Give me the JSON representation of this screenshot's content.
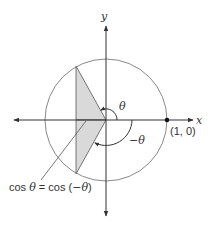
{
  "diagram": {
    "axes": {
      "x_label": "x",
      "y_label": "y"
    },
    "unit_circle": {
      "point_label": "(1, 0)"
    },
    "angles": {
      "positive_label": "θ",
      "negative_label": "−θ"
    },
    "annotation": {
      "lhs": "cos ",
      "lhs_var": "θ",
      "equals": " = cos (",
      "rhs_var": "−θ",
      "close": ")"
    },
    "colors": {
      "line": "#333333",
      "circle": "#7a7a7a",
      "shade": "#d9d9d9"
    }
  }
}
